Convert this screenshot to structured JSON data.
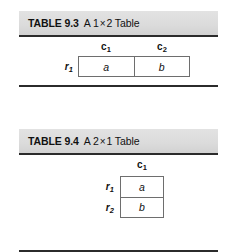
{
  "figures": [
    {
      "id": "9.3",
      "caption": {
        "label": "TABLE 9.3",
        "title_prefix": "A 1",
        "times": "×",
        "title_suffix": "2 Table"
      },
      "column_headers": [
        {
          "base": "c",
          "sub": "1"
        },
        {
          "base": "c",
          "sub": "2"
        }
      ],
      "row_labels": [
        {
          "base": "r",
          "sub": "1"
        }
      ],
      "cells": [
        [
          "a",
          "b"
        ]
      ]
    },
    {
      "id": "9.4",
      "caption": {
        "label": "TABLE 9.4",
        "title_prefix": "A 2",
        "times": "×",
        "title_suffix": "1 Table"
      },
      "column_headers": [
        {
          "base": "c",
          "sub": "1"
        }
      ],
      "row_labels": [
        {
          "base": "r",
          "sub": "1"
        },
        {
          "base": "r",
          "sub": "2"
        }
      ],
      "cells": [
        [
          "a"
        ],
        [
          "b"
        ]
      ]
    }
  ],
  "colors": {
    "caption_background": "#dcdcdc",
    "rule": "#2b2b2b",
    "cell_border": "#6e6e6e",
    "text": "#111111",
    "page_background": "#ffffff"
  }
}
